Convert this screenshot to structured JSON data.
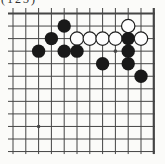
{
  "figure": {
    "label": "(123)"
  },
  "board": {
    "visible_cols": 12,
    "visible_rows": 12,
    "origin_x": 13,
    "origin_y": 13.5,
    "spacing_x": 12.8,
    "spacing_y": 12.55,
    "overhang_left": 5,
    "overhang_top": 5.5,
    "overhang_bottom": 2.5,
    "edge_top_row": 1,
    "edge_right_col": 12,
    "background": "#fbfbf9",
    "line_color": "#454545",
    "line_width": 1,
    "edge_line_width": 2.2,
    "stone_radius": 6.7,
    "black_color": "#191919",
    "white_color": "#fdfdfd",
    "white_stroke": "#1f1f1f",
    "hoshi_radius": 1.8,
    "hoshi": [
      {
        "col": 9,
        "row": 4
      },
      {
        "col": 3,
        "row": 10
      }
    ],
    "stones": [
      {
        "col": 5,
        "row": 2,
        "color": "black"
      },
      {
        "col": 10,
        "row": 2,
        "color": "white"
      },
      {
        "col": 4,
        "row": 3,
        "color": "black"
      },
      {
        "col": 6,
        "row": 3,
        "color": "white"
      },
      {
        "col": 7,
        "row": 3,
        "color": "white"
      },
      {
        "col": 8,
        "row": 3,
        "color": "white"
      },
      {
        "col": 9,
        "row": 3,
        "color": "white"
      },
      {
        "col": 10,
        "row": 3,
        "color": "black"
      },
      {
        "col": 11,
        "row": 3,
        "color": "white"
      },
      {
        "col": 3,
        "row": 4,
        "color": "black"
      },
      {
        "col": 5,
        "row": 4,
        "color": "black"
      },
      {
        "col": 6,
        "row": 4,
        "color": "black"
      },
      {
        "col": 10,
        "row": 4,
        "color": "black"
      },
      {
        "col": 8,
        "row": 5,
        "color": "black"
      },
      {
        "col": 10,
        "row": 5,
        "color": "black"
      },
      {
        "col": 11,
        "row": 6,
        "color": "black"
      }
    ]
  }
}
